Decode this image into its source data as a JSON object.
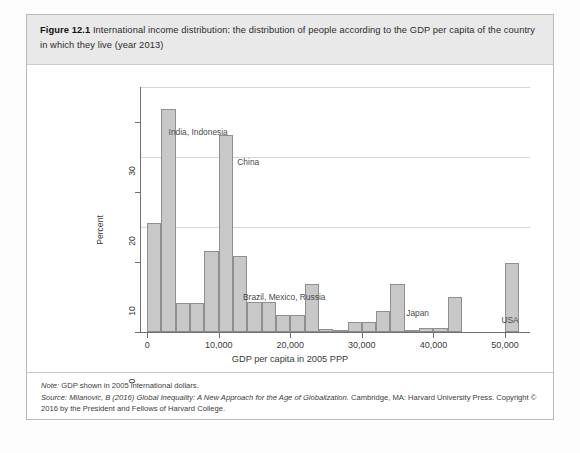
{
  "figure": {
    "number": "Figure 12.1",
    "caption": "International income distribution: the distribution of people according to the GDP per capita of the country in which they live (year 2013)"
  },
  "notes": {
    "note_label": "Note:",
    "note_text": "GDP shown in 2005 international dollars.",
    "source_label": "Source:",
    "source_author": "Milanovic, B (2016)",
    "source_title": "Global Inequality: A New Approach for the Age of Globalization.",
    "source_rest": "Cambridge, MA: Harvard University Press. Copyright © 2016 by the President and Fellows of Harvard College."
  },
  "chart_data": {
    "type": "bar",
    "title": "",
    "xlabel": "GDP per capita in 2005 PPP",
    "ylabel": "Percent",
    "xlim": [
      -1000,
      53500
    ],
    "ylim": [
      0,
      35
    ],
    "xticks": [
      0,
      10000,
      20000,
      30000,
      40000,
      50000
    ],
    "xticklabels": [
      "0",
      "10,000",
      "20,000",
      "30,000",
      "40,000",
      "50,000"
    ],
    "yticks": [
      0,
      10,
      20,
      30
    ],
    "yticklabels": [
      "0",
      "10",
      "20",
      "30"
    ],
    "gridlines_y": [
      15,
      25,
      35
    ],
    "grid": true,
    "legend": "none",
    "bin_width": 2000,
    "bar_color": "#c8c8c8",
    "bar_edge_color": "#8f8f8f",
    "categories": [
      "0-2,000",
      "2,000-4,000",
      "4,000-6,000",
      "6,000-8,000",
      "8,000-10,000",
      "10,000-12,000",
      "12,000-14,000",
      "14,000-16,000",
      "16,000-18,000",
      "18,000-20,000",
      "20,000-22,000",
      "22,000-24,000",
      "24,000-26,000",
      "26,000-28,000",
      "28,000-30,000",
      "30,000-32,000",
      "32,000-34,000",
      "34,000-36,000",
      "36,000-38,000",
      "38,000-40,000",
      "40,000-42,000",
      "42,000-44,000",
      "50,000-52,000"
    ],
    "bins": [
      {
        "x0": 0,
        "x1": 2000,
        "value": 15.6
      },
      {
        "x0": 2000,
        "x1": 4000,
        "value": 31.8
      },
      {
        "x0": 4000,
        "x1": 6000,
        "value": 4.2
      },
      {
        "x0": 6000,
        "x1": 8000,
        "value": 4.2
      },
      {
        "x0": 8000,
        "x1": 10000,
        "value": 11.6
      },
      {
        "x0": 10000,
        "x1": 12000,
        "value": 28.2
      },
      {
        "x0": 12000,
        "x1": 14000,
        "value": 10.8
      },
      {
        "x0": 14000,
        "x1": 16000,
        "value": 4.3
      },
      {
        "x0": 16000,
        "x1": 18000,
        "value": 4.3
      },
      {
        "x0": 18000,
        "x1": 20000,
        "value": 2.4
      },
      {
        "x0": 20000,
        "x1": 22000,
        "value": 2.4
      },
      {
        "x0": 22000,
        "x1": 24000,
        "value": 6.9
      },
      {
        "x0": 24000,
        "x1": 26000,
        "value": 0.5
      },
      {
        "x0": 26000,
        "x1": 28000,
        "value": 0.2
      },
      {
        "x0": 28000,
        "x1": 30000,
        "value": 1.5
      },
      {
        "x0": 30000,
        "x1": 32000,
        "value": 1.5
      },
      {
        "x0": 32000,
        "x1": 34000,
        "value": 3.0
      },
      {
        "x0": 34000,
        "x1": 36000,
        "value": 6.8
      },
      {
        "x0": 36000,
        "x1": 38000,
        "value": 0.2
      },
      {
        "x0": 38000,
        "x1": 40000,
        "value": 0.6
      },
      {
        "x0": 40000,
        "x1": 42000,
        "value": 0.6
      },
      {
        "x0": 42000,
        "x1": 44000,
        "value": 5.0
      },
      {
        "x0": 50000,
        "x1": 52000,
        "value": 9.9
      }
    ],
    "annotations": [
      {
        "text": "India, Indonesia",
        "x": 3000,
        "y": 28.5
      },
      {
        "text": "China",
        "x": 12600,
        "y": 24.2
      },
      {
        "text": "Brazil, Mexico, Russia",
        "x": 13400,
        "y": 4.8
      },
      {
        "text": "Japan",
        "x": 36200,
        "y": 2.6
      },
      {
        "text": "USA",
        "x": 49500,
        "y": 1.6
      }
    ]
  }
}
